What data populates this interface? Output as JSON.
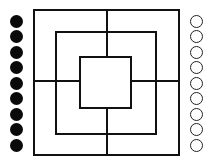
{
  "game": {
    "title": "Nine Men's Morris",
    "board": {
      "squares": [
        {
          "name": "outer",
          "left": 33,
          "top": 9,
          "right": 180,
          "bottom": 156
        },
        {
          "name": "middle",
          "left": 55,
          "top": 31,
          "right": 157,
          "bottom": 135
        },
        {
          "name": "inner",
          "left": 79,
          "top": 56,
          "right": 132,
          "bottom": 109
        }
      ],
      "center_x": 107,
      "center_y": 81,
      "line_color": "#111111"
    },
    "players": {
      "black": {
        "label": "Black pieces",
        "count": 9,
        "color": "#0a0a0a",
        "x": 16
      },
      "white": {
        "label": "White pieces",
        "count": 9,
        "color": "#ffffff",
        "x": 196
      }
    },
    "piece_rows_y": [
      21,
      36,
      52,
      67,
      83,
      98,
      114,
      129,
      145
    ]
  }
}
